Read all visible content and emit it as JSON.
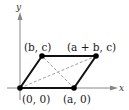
{
  "diagram": {
    "type": "parallelogram-coordinate-figure",
    "axes": {
      "x_label": "x",
      "y_label": "y"
    },
    "vertices": [
      {
        "id": "origin",
        "label": "(0, 0)"
      },
      {
        "id": "a0",
        "label": "(a, 0)"
      },
      {
        "id": "bc",
        "label": "(b, c)"
      },
      {
        "id": "abc",
        "label": "(a + b, c)"
      }
    ],
    "diagonals": [
      {
        "from": "(0, 0)",
        "to": "(a + b, c)",
        "style": "dashed"
      },
      {
        "from": "(a, 0)",
        "to": "(b, c)",
        "style": "dashed"
      }
    ],
    "colors": {
      "edge": "#111111",
      "axis": "#888888",
      "diagonal": "#a0a0a0",
      "vertex": "#000000"
    }
  }
}
